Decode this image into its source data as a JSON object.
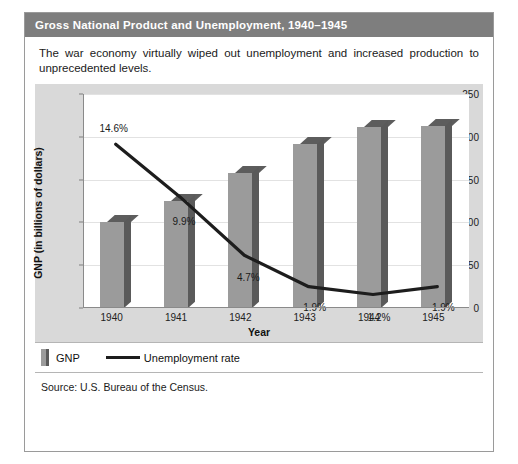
{
  "figure": {
    "title": "Gross National Product and Unemployment, 1940–1945",
    "caption": "The war economy virtually wiped out unemployment and increased production to unprecedented levels.",
    "source": "Source: U.S. Bureau of the Census."
  },
  "legend": {
    "gnp_label": "GNP",
    "unemployment_label": "Unemployment rate"
  },
  "colors": {
    "header_bg": "#7e7e7e",
    "panel_bg": "#d9d9d9",
    "plot_bg": "#ffffff",
    "bar_face": "#9b9b9b",
    "bar_shadow": "#5a5a5a",
    "line": "#1d1d1d",
    "grid": "#e2e2e2",
    "frame_border": "#9a9a9a"
  },
  "chart_data": {
    "type": "bar",
    "title": "Gross National Product and Unemployment, 1940–1945",
    "xlabel": "Year",
    "ylabel": "GNP (in billions of dollars)",
    "categories": [
      "1940",
      "1941",
      "1942",
      "1943",
      "1944",
      "1945"
    ],
    "ylim": [
      0,
      250
    ],
    "yticks": [
      0,
      50,
      100,
      150,
      200,
      250
    ],
    "grid": true,
    "legend_position": "bottom",
    "series": [
      {
        "name": "GNP",
        "type": "bar",
        "unit": "billions of dollars",
        "values": [
          100,
          125,
          158,
          192,
          211,
          213
        ]
      },
      {
        "name": "Unemployment rate",
        "type": "line",
        "unit": "percent",
        "values": [
          14.6,
          9.9,
          4.7,
          1.9,
          1.2,
          1.9
        ],
        "labels": [
          "14.6%",
          "9.9%",
          "4.7%",
          "1.9%",
          "1.2%",
          "1.9%"
        ]
      }
    ]
  }
}
